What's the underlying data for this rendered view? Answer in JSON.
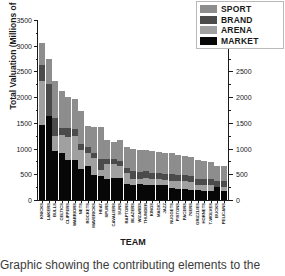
{
  "caption": "Graphic showing the contributing elements to the",
  "chart_data": {
    "type": "bar",
    "stacked": true,
    "title": "",
    "xlabel": "TEAM",
    "ylabel": "Total Valuation (Millions of $)",
    "ylim": [
      0,
      3500
    ],
    "ytick_labels": [
      "0",
      "500",
      "1000",
      "1500",
      "2000",
      "2500",
      "3000",
      "3500"
    ],
    "ytick_values": [
      0,
      500,
      1000,
      1500,
      2000,
      2500,
      3000,
      3500
    ],
    "ytick_labels_right": [
      "0",
      "500",
      "1000",
      "1500",
      "2000",
      "2500"
    ],
    "ytick_values_right": [
      0,
      500,
      1000,
      1500,
      2000,
      2500
    ],
    "grid": false,
    "legend_position": "top-right",
    "legend": [
      {
        "name": "SPORT",
        "color": "#8d8d8d"
      },
      {
        "name": "BRAND",
        "color": "#4b4b4b"
      },
      {
        "name": "ARENA",
        "color": "#a0a0a0"
      },
      {
        "name": "MARKET",
        "color": "#070707"
      }
    ],
    "categories": [
      "KNICKS",
      "LAKERS",
      "BULLS",
      "CELTICS",
      "CLIPPERS",
      "WARRIORS",
      "NETS",
      "ROCKETS",
      "MAVERICKS",
      "HEAT",
      "SPURS",
      "CAVALIERS",
      "SUNS",
      "RAPTORS",
      "BLAZERS",
      "WIZARDS",
      "THUNDER",
      "KINGS",
      "MAGIC",
      "JAZZ",
      "NUGGETS",
      "PISTONS",
      "PACERS",
      "76ERS",
      "GRIZZLIES",
      "HORNETS",
      "T-WOLVES",
      "BUCKS",
      "PELICANS"
    ],
    "series": [
      {
        "name": "MARKET",
        "color": "#070707",
        "values": [
          1450,
          1630,
          960,
          920,
          780,
          775,
          610,
          665,
          480,
          470,
          410,
          430,
          435,
          310,
          300,
          305,
          300,
          300,
          295,
          290,
          230,
          215,
          205,
          200,
          190,
          185,
          180,
          250,
          175
        ]
      },
      {
        "name": "ARENA",
        "color": "#a0a0a0",
        "values": [
          870,
          0,
          290,
          340,
          455,
          470,
          355,
          245,
          345,
          110,
          290,
          270,
          225,
          225,
          115,
          110,
          135,
          100,
          120,
          95,
          145,
          150,
          165,
          150,
          95,
          100,
          115,
          0,
          85
        ]
      },
      {
        "name": "BRAND",
        "color": "#4b4b4b",
        "values": [
          300,
          620,
          340,
          150,
          165,
          140,
          130,
          115,
          95,
          210,
          90,
          90,
          100,
          95,
          140,
          135,
          125,
          135,
          120,
          125,
          130,
          125,
          115,
          120,
          130,
          125,
          115,
          120,
          110
        ]
      },
      {
        "name": "SPORT",
        "color": "#8d8d8d",
        "values": [
          430,
          500,
          720,
          715,
          600,
          585,
          630,
          405,
          500,
          635,
          385,
          345,
          415,
          395,
          440,
          425,
          415,
          420,
          405,
          400,
          400,
          390,
          375,
          365,
          370,
          350,
          335,
          290,
          285
        ]
      }
    ]
  }
}
